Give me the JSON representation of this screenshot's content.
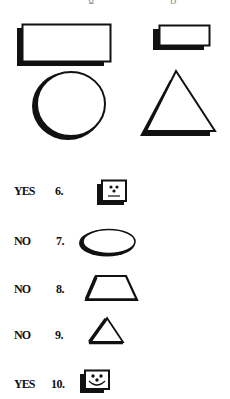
{
  "header": {
    "cutoff_text_left": "g",
    "cutoff_text_right": "p"
  },
  "example_shapes": [
    {
      "name": "large-rectangle"
    },
    {
      "name": "small-rectangle"
    },
    {
      "name": "circle"
    },
    {
      "name": "triangle"
    }
  ],
  "items": [
    {
      "answer": "YES",
      "number": "6.",
      "shape": "face-box-neutral"
    },
    {
      "answer": "NO",
      "number": "7.",
      "shape": "ellipse"
    },
    {
      "answer": "NO",
      "number": "8.",
      "shape": "trapezoid"
    },
    {
      "answer": "NO",
      "number": "9.",
      "shape": "triangle"
    },
    {
      "answer": "YES",
      "number": "10.",
      "shape": "face-box-smile"
    }
  ],
  "colors": {
    "ink": "#111111",
    "background": "#ffffff"
  }
}
